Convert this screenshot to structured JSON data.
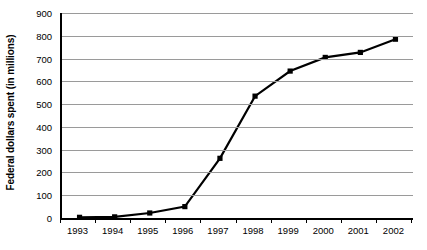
{
  "chart_data": {
    "type": "line",
    "title": "",
    "xlabel": "",
    "ylabel": "Federal dollars spent (in millions)",
    "categories": [
      "1993",
      "1994",
      "1995",
      "1996",
      "1997",
      "1998",
      "1999",
      "2000",
      "2001",
      "2002"
    ],
    "values": [
      3,
      5,
      22,
      50,
      262,
      535,
      645,
      705,
      727,
      785
    ],
    "series": [
      {
        "name": "Federal dollars spent",
        "values": [
          3,
          5,
          22,
          50,
          262,
          535,
          645,
          705,
          727,
          785
        ]
      }
    ],
    "ylim": [
      0,
      900
    ],
    "yticks": [
      0,
      100,
      200,
      300,
      400,
      500,
      600,
      700,
      800,
      900
    ],
    "ytick_labels": [
      "0",
      "100",
      "200",
      "300",
      "400",
      "500",
      "600",
      "700",
      "800",
      "900"
    ],
    "grid": true,
    "grid_axis": "y",
    "legend": false,
    "legend_position": "none",
    "marker": "square",
    "line_color": "#000000",
    "marker_color": "#000000",
    "grid_color": "#9a9a9a",
    "axis_color": "#000000",
    "background_color": "#ffffff"
  }
}
